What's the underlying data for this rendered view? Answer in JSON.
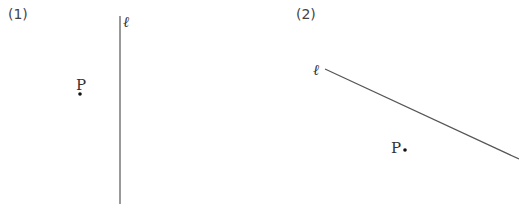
{
  "diagrams": [
    {
      "label": "(1)",
      "line": {
        "name": "ℓ",
        "x1": 120,
        "y1": 16,
        "x2": 120,
        "y2": 204,
        "orientation": "vertical"
      },
      "point": {
        "name": "P",
        "x": 80,
        "y": 94
      }
    },
    {
      "label": "(2)",
      "line": {
        "name": "ℓ",
        "x1": 325,
        "y1": 69,
        "x2": 519,
        "y2": 159,
        "orientation": "oblique"
      },
      "point": {
        "name": "P",
        "x": 405,
        "y": 150
      }
    }
  ],
  "colors": {
    "line": "#555555",
    "text": "#333333",
    "point": "#111111"
  }
}
